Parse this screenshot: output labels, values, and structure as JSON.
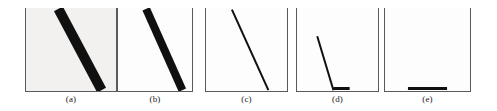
{
  "figure": {
    "background_color": "#ffffff",
    "axis_color": "#5a5a5a",
    "stroke_color": "#101010",
    "panel_count": 5
  },
  "panels": [
    {
      "id": "a",
      "label": "(a)",
      "description": "thick diagonal band, original line",
      "fill_tint": "#f2f1ef",
      "stroke_width_px": 10,
      "line": {
        "x1_pct": 36,
        "y1_pct": 1,
        "x2_pct": 84,
        "y2_pct": 99
      },
      "baseline_segment": null
    },
    {
      "id": "b",
      "label": "(b)",
      "description": "eroded diagonal band, slightly thinner",
      "fill_tint": "#fdfdfd",
      "stroke_width_px": 8,
      "line": {
        "x1_pct": 38,
        "y1_pct": 1,
        "x2_pct": 87,
        "y2_pct": 99
      },
      "baseline_segment": null
    },
    {
      "id": "c",
      "label": "(c)",
      "description": "thin diagonal line, one pixel wide skeleton",
      "fill_tint": "#fdfdfd",
      "stroke_width_px": 2,
      "line": {
        "x1_pct": 32,
        "y1_pct": 2,
        "x2_pct": 77,
        "y2_pct": 99
      },
      "baseline_segment": null
    },
    {
      "id": "d",
      "label": "(d)",
      "description": "short steep residual line meeting a small horizontal foot on the baseline",
      "fill_tint": "#fdfdfd",
      "stroke_width_px": 2,
      "line": {
        "x1_pct": 25,
        "y1_pct": 34,
        "x2_pct": 45,
        "y2_pct": 99
      },
      "baseline_segment": {
        "x1_pct": 45,
        "x2_pct": 65,
        "thickness_px": 3
      }
    },
    {
      "id": "e",
      "label": "(e)",
      "description": "only a short horizontal segment remains on the baseline",
      "fill_tint": "#fdfdfd",
      "stroke_width_px": 0,
      "line": null,
      "baseline_segment": {
        "x1_pct": 27,
        "x2_pct": 73,
        "thickness_px": 3
      }
    }
  ]
}
